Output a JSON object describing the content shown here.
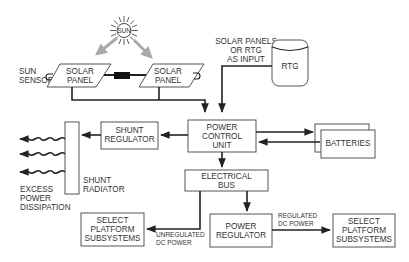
{
  "diagram": {
    "nodes": {
      "sun": {
        "label": "SUN"
      },
      "sun_sensor": {
        "line1": "SUN",
        "line2": "SENSOR"
      },
      "solar_panel_left": {
        "line1": "SOLAR",
        "line2": "PANEL"
      },
      "solar_panel_right": {
        "line1": "SOLAR",
        "line2": "PANEL"
      },
      "input_note": {
        "line1": "SOLAR PANELS",
        "line2": "OR RTG",
        "line3": "AS INPUT"
      },
      "rtg": {
        "label": "RTG"
      },
      "power_control_unit": {
        "line1": "POWER",
        "line2": "CONTROL",
        "line3": "UNIT"
      },
      "batteries": {
        "label": "BATTERIES"
      },
      "shunt_regulator": {
        "line1": "SHUNT",
        "line2": "REGULATOR"
      },
      "shunt_radiator": {
        "line1": "SHUNT",
        "line2": "RADIATOR"
      },
      "excess_power": {
        "line1": "EXCESS",
        "line2": "POWER",
        "line3": "DISSIPATION"
      },
      "electrical_bus": {
        "line1": "ELECTRICAL",
        "line2": "BUS"
      },
      "power_regulator": {
        "line1": "POWER",
        "line2": "REGULATOR"
      },
      "select_platform_left": {
        "line1": "SELECT",
        "line2": "PLATFORM",
        "line3": "SUBSYSTEMS"
      },
      "select_platform_right": {
        "line1": "SELECT",
        "line2": "PLATFORM",
        "line3": "SUBSYSTEMS"
      }
    },
    "edge_labels": {
      "unregulated": {
        "line1": "UNREGULATED",
        "line2": "DC POWER"
      },
      "regulated": {
        "line1": "REGULATED",
        "line2": "DC POWER"
      }
    },
    "edges": [
      {
        "from": "sun",
        "to": "solar_panel_left",
        "type": "light-ray"
      },
      {
        "from": "sun",
        "to": "solar_panel_right",
        "type": "light-ray"
      },
      {
        "from": "solar_panel_left",
        "to": "power_control_unit"
      },
      {
        "from": "solar_panel_right",
        "to": "power_control_unit"
      },
      {
        "from": "rtg",
        "to": "power_control_unit"
      },
      {
        "from": "power_control_unit",
        "to": "batteries"
      },
      {
        "from": "batteries",
        "to": "power_control_unit"
      },
      {
        "from": "power_control_unit",
        "to": "shunt_regulator"
      },
      {
        "from": "shunt_regulator",
        "to": "shunt_radiator"
      },
      {
        "from": "shunt_radiator",
        "to": "excess_power",
        "type": "heat-wave"
      },
      {
        "from": "power_control_unit",
        "to": "electrical_bus"
      },
      {
        "from": "electrical_bus",
        "to": "select_platform_left",
        "label": "UNREGULATED DC POWER"
      },
      {
        "from": "electrical_bus",
        "to": "power_regulator"
      },
      {
        "from": "power_regulator",
        "to": "select_platform_right",
        "label": "REGULATED DC POWER"
      }
    ],
    "colors": {
      "line": "#222222",
      "box_stroke": "#555555",
      "text": "#333333",
      "ray": "#aaaaaa"
    }
  }
}
